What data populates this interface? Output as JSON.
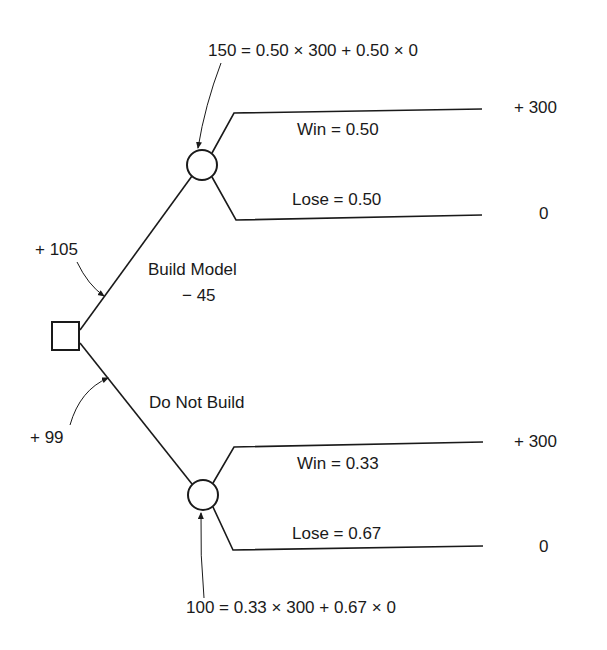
{
  "diagram": {
    "type": "decision-tree",
    "decision_node": {
      "shape": "square",
      "options": [
        {
          "label": "Build Model",
          "cost": "− 45",
          "expected_value_label": "+ 105",
          "chance_node": {
            "equation": "150 = 0.50 × 300 + 0.50 × 0",
            "outcomes": [
              {
                "label": "Win = 0.50",
                "payoff": "+ 300"
              },
              {
                "label": "Lose = 0.50",
                "payoff": "0"
              }
            ]
          }
        },
        {
          "label": "Do Not Build",
          "expected_value_label": "+ 99",
          "chance_node": {
            "equation": "100 = 0.33 × 300 + 0.67 × 0",
            "outcomes": [
              {
                "label": "Win = 0.33",
                "payoff": "+ 300"
              },
              {
                "label": "Lose = 0.67",
                "payoff": "0"
              }
            ]
          }
        }
      ]
    },
    "colors": {
      "line": "#1a1a1a",
      "background": "#ffffff"
    }
  }
}
